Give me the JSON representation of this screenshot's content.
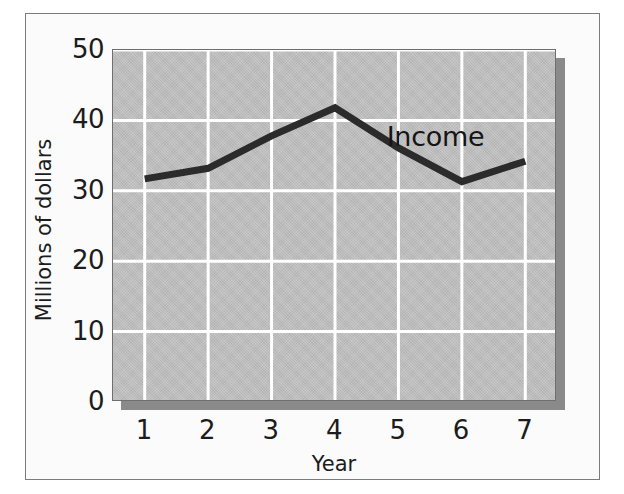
{
  "figure": {
    "frame_border_color": "#7b7b7b",
    "page_background": "#ffffff",
    "plot_background": "#bcbcbc",
    "gridline_color": "#ffffff",
    "series_color": "#2b2b2b",
    "shadow_color": "#8a8a8a"
  },
  "chart_data": {
    "type": "line",
    "title": "",
    "subtitle": "",
    "xlabel": "Year",
    "ylabel": "Millions of dollars",
    "x": [
      1,
      2,
      3,
      4,
      5,
      6,
      7
    ],
    "categories": [
      "1",
      "2",
      "3",
      "4",
      "5",
      "6",
      "7"
    ],
    "xtick_labels": [
      "1",
      "2",
      "3",
      "4",
      "5",
      "6",
      "7"
    ],
    "ytick_labels": [
      "0",
      "10",
      "20",
      "30",
      "40",
      "50"
    ],
    "yticks": [
      0,
      10,
      20,
      30,
      40,
      50
    ],
    "xlim": [
      0.5,
      7.5
    ],
    "ylim": [
      0,
      50
    ],
    "grid": true,
    "grid_axis": "both",
    "legend": false,
    "legend_position": "none",
    "series": [
      {
        "name": "Income",
        "values": [
          31.7,
          33.2,
          37.8,
          41.8,
          36.1,
          31.3,
          34.2
        ],
        "color": "#2b2b2b",
        "line_width": 7,
        "markers": false
      }
    ],
    "annotations": [
      {
        "text": "Income",
        "x": 5.6,
        "y": 37.2
      }
    ]
  }
}
